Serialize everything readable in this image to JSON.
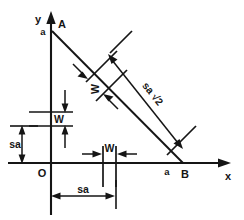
{
  "figure": {
    "background_color": "#ffffff",
    "ink_color": "#151515",
    "axes": {
      "y_label": "y",
      "x_label": "x",
      "origin_label": "O"
    },
    "points": [
      {
        "name": "A",
        "label": "A",
        "intercept_label": "a"
      },
      {
        "name": "B",
        "label": "B",
        "intercept_label": "a"
      }
    ],
    "dimensions": [
      {
        "id": "w-vertical",
        "label": "W",
        "orientation": "vertical",
        "location": "y-axis"
      },
      {
        "id": "sa-vertical",
        "label": "sa",
        "orientation": "vertical",
        "location": "left-of-y-axis"
      },
      {
        "id": "w-horizontal",
        "label": "W",
        "orientation": "horizontal",
        "location": "above-x-axis"
      },
      {
        "id": "sa-horizontal",
        "label": "sa",
        "orientation": "horizontal",
        "location": "below-x-axis"
      },
      {
        "id": "w-diagonal",
        "label": "W",
        "orientation": "perpendicular-to-hypotenuse",
        "location": "upper-hypotenuse"
      },
      {
        "id": "sa-diagonal",
        "label": "sa √2",
        "orientation": "parallel-to-hypotenuse",
        "location": "lower-hypotenuse"
      }
    ]
  }
}
